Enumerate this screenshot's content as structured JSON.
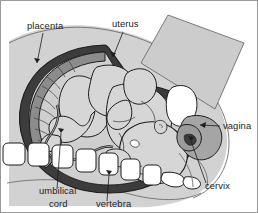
{
  "figure": {
    "background_color": "#ffffff",
    "border_color": "#9a9a9a"
  },
  "labels": [
    {
      "id": "placenta",
      "text": "placenta",
      "x": 26,
      "y": 28,
      "anchor": "start"
    },
    {
      "id": "uterus",
      "text": "uterus",
      "x": 111,
      "y": 26,
      "anchor": "start"
    },
    {
      "id": "vagina",
      "text": "vagina",
      "x": 222,
      "y": 128,
      "anchor": "start"
    },
    {
      "id": "cervix",
      "text": "cervix",
      "x": 204,
      "y": 188,
      "anchor": "start"
    },
    {
      "id": "umbilical-cord-line1",
      "text": "umbilical",
      "x": 38,
      "y": 193,
      "anchor": "start"
    },
    {
      "id": "umbilical-cord-line2",
      "text": "cord",
      "x": 48,
      "y": 206,
      "anchor": "start"
    },
    {
      "id": "vertebra",
      "text": "vertebra",
      "x": 95,
      "y": 206,
      "anchor": "start"
    }
  ],
  "colors": {
    "outline": "#1d1d1d",
    "body_fill": "#d2d2d2",
    "uterus_wall": "#3c3c3c",
    "uterus_wall_outer": "#8f8f8f",
    "amniotic_fill": "#cfcfcf",
    "fetus_fill": "#d6d6d6",
    "placenta_fill": "#8c8c8c",
    "bone_fill": "#ffffff",
    "cervix_fill": "#a5a5a5",
    "bladder_fill": "#ffffff"
  },
  "structures": [
    "maternal abdominal wall",
    "uterine wall",
    "amniotic cavity",
    "placenta",
    "fetus",
    "umbilical cord",
    "vertebral column",
    "cervix",
    "vagina",
    "bladder"
  ]
}
